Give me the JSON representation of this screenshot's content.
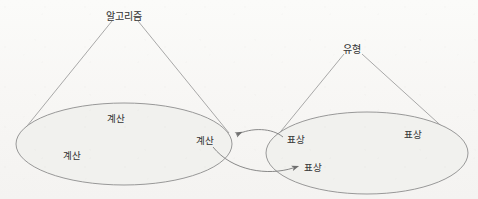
{
  "diagram": {
    "type": "two-domain-mapping-cone-diagram",
    "background_color": "#faf9f7",
    "ellipse_fill_color": "#f1f1ee",
    "stroke_color": "#8b8b8b",
    "text_color": "#3b3b3b",
    "left_group": {
      "apex_label": "알고리즘",
      "apex_x": 124,
      "apex_y": 17,
      "ellipse": {
        "cx": 124,
        "cy": 144,
        "rx": 108,
        "ry": 41
      },
      "members": [
        {
          "label": "계산",
          "x": 116,
          "y": 119
        },
        {
          "label": "계산",
          "x": 72,
          "y": 156
        },
        {
          "label": "계산",
          "x": 205,
          "y": 141
        }
      ]
    },
    "right_group": {
      "apex_label": "유형",
      "apex_x": 352,
      "apex_y": 50,
      "ellipse": {
        "cx": 367,
        "cy": 153,
        "rx": 101,
        "ry": 41
      },
      "members": [
        {
          "label": "표상",
          "x": 296,
          "y": 140
        },
        {
          "label": "표상",
          "x": 413,
          "y": 135
        },
        {
          "label": "표상",
          "x": 313,
          "y": 168
        }
      ]
    },
    "connectors": [
      {
        "name": "right-to-left-arrow",
        "direction": "left",
        "from_label": "표상",
        "to_label": "계산",
        "arrowhead_x": 233,
        "arrowhead_y": 136
      },
      {
        "name": "left-to-right-arrow",
        "direction": "right",
        "from_label": "계산",
        "to_label": "표상",
        "arrowhead_x": 297,
        "arrowhead_y": 168
      }
    ]
  }
}
